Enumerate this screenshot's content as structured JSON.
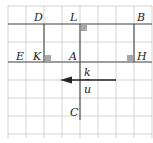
{
  "diagram": {
    "grid": {
      "cols": 8,
      "rows": 7,
      "cell": 18,
      "origin": [
        8,
        6
      ],
      "color": "#c8c8c8"
    },
    "line_color": "#555555",
    "marker_color": "#a8a8a8",
    "points": {
      "D": {
        "label": "D",
        "x": 44,
        "y": 24
      },
      "L": {
        "label": "L",
        "x": 80,
        "y": 24
      },
      "B": {
        "label": "B",
        "x": 134,
        "y": 24
      },
      "E": {
        "label": "E",
        "x": 26,
        "y": 62
      },
      "K": {
        "label": "K",
        "x": 44,
        "y": 62
      },
      "A": {
        "label": "A",
        "x": 80,
        "y": 62
      },
      "H": {
        "label": "H",
        "x": 134,
        "y": 62
      },
      "C": {
        "label": "C",
        "x": 80,
        "y": 116
      }
    },
    "vector": {
      "label": "u",
      "arrow_prefix": "→",
      "from": [
        116,
        80
      ],
      "to": [
        62,
        80
      ]
    },
    "scalar_label": "k"
  }
}
